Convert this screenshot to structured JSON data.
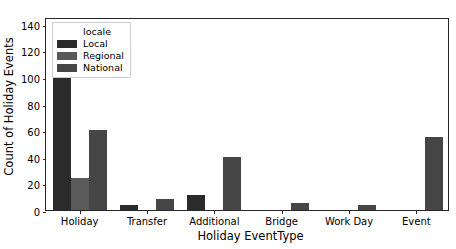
{
  "chart_data": {
    "type": "bar",
    "title": "",
    "xlabel": "Holiday EventType",
    "ylabel": "Count of Holiday Events",
    "categories": [
      "Holiday",
      "Transfer",
      "Additional",
      "Bridge",
      "Work Day",
      "Event"
    ],
    "series": [
      {
        "name": "Local",
        "color": "#2b2b2b",
        "values": [
          113,
          4,
          11,
          0,
          0,
          0
        ]
      },
      {
        "name": "Regional",
        "color": "#5a5a5a",
        "values": [
          24,
          0,
          0,
          0,
          0,
          0
        ]
      },
      {
        "name": "National",
        "color": "#464646",
        "values": [
          60,
          8,
          40,
          5,
          4,
          55
        ]
      }
    ],
    "ylim": [
      0,
      145
    ],
    "yticks": [
      0,
      20,
      40,
      60,
      80,
      100,
      120,
      140
    ],
    "ytick_labels": [
      "0",
      "20",
      "40",
      "60",
      "80",
      "100",
      "120",
      "140"
    ],
    "grid": false,
    "legend": {
      "title": "locale",
      "position": "upper left",
      "entries": [
        "Local",
        "Regional",
        "National"
      ]
    }
  }
}
